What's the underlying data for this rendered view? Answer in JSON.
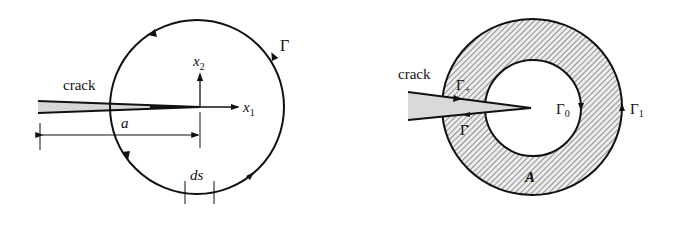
{
  "left_diagram": {
    "crack_label": "crack",
    "contour_label": "Γ",
    "axis_x1": {
      "base": "x",
      "sub": "1"
    },
    "axis_x2": {
      "base": "x",
      "sub": "2"
    },
    "crack_length_label": "a",
    "arc_element_label": "ds"
  },
  "right_diagram": {
    "crack_label": "crack",
    "upper_face_label": {
      "base": "Γ",
      "sub": "+"
    },
    "lower_face_label": {
      "base": "Γ",
      "sub": "-"
    },
    "inner_contour_label": {
      "base": "Γ",
      "sub": "0"
    },
    "outer_contour_label": {
      "base": "Γ",
      "sub": "1"
    },
    "area_label": "A"
  },
  "colors": {
    "line": "#111111",
    "crack_fill": "#cfcfcf",
    "hatch": "#555555",
    "background": "#ffffff"
  }
}
